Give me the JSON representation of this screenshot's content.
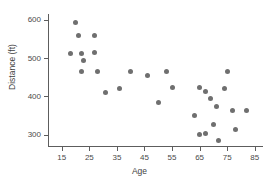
{
  "chart_data": {
    "type": "scatter",
    "title": "",
    "xlabel": "Age",
    "ylabel": "Distance (ft)",
    "xlim": [
      10,
      88
    ],
    "ylim": [
      270,
      615
    ],
    "xticks": [
      15,
      25,
      35,
      45,
      55,
      65,
      75,
      85
    ],
    "xtick_labels": [
      "15",
      "25",
      "35",
      "45",
      "55",
      "65",
      "75",
      "85"
    ],
    "yticks": [
      300,
      400,
      500,
      600
    ],
    "ytick_labels": [
      "300",
      "400",
      "500",
      "600"
    ],
    "grid": false,
    "legend": null,
    "marker_color": "#6f6f6f",
    "axis_color": "#5d5d5d",
    "background_color": "#ffffff",
    "series": [
      {
        "name": "observations",
        "points": [
          {
            "x": 20,
            "y": 592
          },
          {
            "x": 21,
            "y": 558
          },
          {
            "x": 27,
            "y": 560
          },
          {
            "x": 18,
            "y": 511
          },
          {
            "x": 22,
            "y": 512
          },
          {
            "x": 27,
            "y": 515
          },
          {
            "x": 23,
            "y": 493
          },
          {
            "x": 22,
            "y": 464
          },
          {
            "x": 28,
            "y": 464
          },
          {
            "x": 31,
            "y": 411
          },
          {
            "x": 36,
            "y": 421
          },
          {
            "x": 40,
            "y": 465
          },
          {
            "x": 46,
            "y": 454
          },
          {
            "x": 50,
            "y": 383
          },
          {
            "x": 53,
            "y": 464
          },
          {
            "x": 55,
            "y": 423
          },
          {
            "x": 63,
            "y": 350
          },
          {
            "x": 65,
            "y": 422
          },
          {
            "x": 65,
            "y": 301
          },
          {
            "x": 67,
            "y": 412
          },
          {
            "x": 67,
            "y": 302
          },
          {
            "x": 69,
            "y": 394
          },
          {
            "x": 70,
            "y": 325
          },
          {
            "x": 71,
            "y": 374
          },
          {
            "x": 72,
            "y": 285
          },
          {
            "x": 74,
            "y": 420
          },
          {
            "x": 75,
            "y": 464
          },
          {
            "x": 77,
            "y": 363
          },
          {
            "x": 78,
            "y": 313
          },
          {
            "x": 82,
            "y": 362
          }
        ]
      }
    ]
  }
}
